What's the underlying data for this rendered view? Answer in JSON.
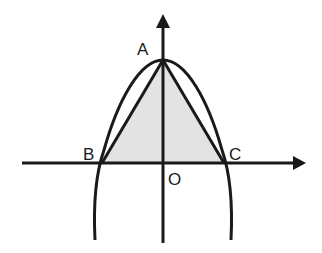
{
  "diagram": {
    "colors": {
      "stroke": "#1a1a1a",
      "fill": "#e3e3e3",
      "background": "#ffffff"
    },
    "labels": {
      "A": "A",
      "B": "B",
      "C": "C",
      "O": "O"
    },
    "points": {
      "A": [
        163,
        60
      ],
      "B": [
        102,
        163
      ],
      "C": [
        224,
        163
      ],
      "O": [
        163,
        163
      ]
    },
    "axes": {
      "x_axis": {
        "from": [
          22,
          163
        ],
        "to": [
          305,
          163
        ],
        "arrow": true
      },
      "y_axis": {
        "from": [
          163,
          243
        ],
        "to": [
          163,
          15
        ],
        "arrow": true
      }
    },
    "curves": {
      "parabola": {
        "vertex": [
          163,
          60
        ],
        "left_end": [
          95,
          240
        ],
        "right_end": [
          231,
          240
        ]
      }
    },
    "shapes": {
      "triangle_ABC": {
        "vertices": [
          "A",
          "B",
          "C"
        ],
        "shaded": true
      }
    }
  }
}
